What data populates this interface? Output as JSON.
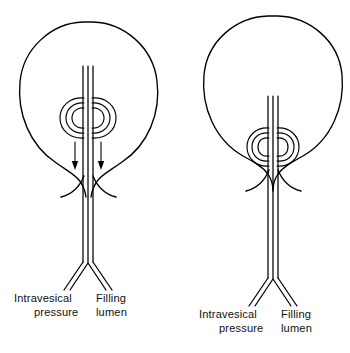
{
  "figure": {
    "type": "medical-line-diagram",
    "background_color": "#ffffff",
    "line_color": "#000000",
    "panel_count": 2,
    "cropped_caption_fragment": ""
  },
  "panels": [
    {
      "id": "left-panel",
      "name": "coil-positioned-in-bladder-body",
      "bladder_shape": "rounded-pear",
      "coil_location": "mid-bladder, above the bladder neck",
      "coil_turn_count": 3,
      "arrows": {
        "count": 2,
        "direction": "down",
        "meaning": "intravesical pressure transmitted downward along the catheter"
      },
      "bladder_neck": "open funnel, flared",
      "labels": {
        "left_line1": "Intravesical",
        "left_line2": "pressure",
        "right_line1": "Filling",
        "right_line2": "lumen"
      }
    },
    {
      "id": "right-panel",
      "name": "coil-seated-at-bladder-neck",
      "bladder_shape": "round",
      "coil_location": "at the bladder neck / outlet",
      "coil_turn_count": 3,
      "arrows": {
        "count": 0,
        "direction": "",
        "meaning": "no pressure arrows shown"
      },
      "bladder_neck": "open funnel, flared, occupied by coil",
      "labels": {
        "left_line1": "Intravesical",
        "left_line2": "pressure",
        "right_line1": "Filling",
        "right_line2": "lumen"
      }
    }
  ]
}
